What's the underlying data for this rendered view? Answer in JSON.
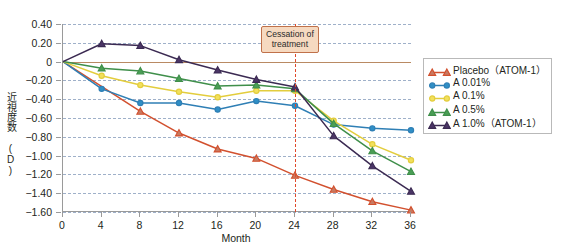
{
  "chart_data": {
    "type": "line",
    "title": "",
    "xlabel": "Month",
    "ylabel": "近視度数 (D)",
    "x": [
      0,
      4,
      8,
      12,
      16,
      20,
      24,
      28,
      32,
      36
    ],
    "xlim": [
      0,
      36
    ],
    "ylim": [
      -1.6,
      0.4
    ],
    "xticks": [
      "0",
      "4",
      "8",
      "12",
      "16",
      "20",
      "24",
      "28",
      "32",
      "36"
    ],
    "yticks": [
      "0.40",
      "0.20",
      "0",
      "-0.20",
      "-0.40",
      "-0.60",
      "-0.80",
      "-1.00",
      "-1.20",
      "-1.40",
      "-1.60"
    ],
    "ytick_values": [
      0.4,
      0.2,
      0,
      -0.2,
      -0.4,
      -0.6,
      -0.8,
      -1.0,
      -1.2,
      -1.4,
      -1.6
    ],
    "grid": true,
    "zero_reference_line": 0,
    "legend_position": "right",
    "series": [
      {
        "name": "Placebo（ATOM-1）",
        "color": "#d2502e",
        "marker": "triangle",
        "marker_fill": "#c87a62",
        "x": [
          0,
          8,
          12,
          16,
          20,
          24,
          28,
          32,
          36
        ],
        "values": [
          0,
          -0.53,
          -0.76,
          -0.93,
          -1.03,
          -1.21,
          -1.36,
          -1.49,
          -1.58
        ]
      },
      {
        "name": "A 0.01%",
        "color": "#2f7fb5",
        "marker": "circle",
        "marker_fill": "#2f8fc6",
        "x": [
          0,
          4,
          8,
          12,
          16,
          20,
          24,
          28,
          32,
          36
        ],
        "values": [
          0,
          -0.29,
          -0.44,
          -0.44,
          -0.51,
          -0.42,
          -0.47,
          -0.67,
          -0.71,
          -0.73
        ]
      },
      {
        "name": "A 0.1%",
        "color": "#e3cd3d",
        "marker": "circle",
        "marker_fill": "#f2e05c",
        "x": [
          0,
          4,
          8,
          12,
          16,
          20,
          24,
          28,
          32,
          36
        ],
        "values": [
          0,
          -0.15,
          -0.25,
          -0.32,
          -0.38,
          -0.31,
          -0.31,
          -0.63,
          -0.88,
          -1.05
        ]
      },
      {
        "name": "A 0.5%",
        "color": "#3f8f4a",
        "marker": "triangle",
        "marker_fill": "#4a9e55",
        "x": [
          0,
          4,
          8,
          12,
          16,
          20,
          24,
          28,
          32,
          36
        ],
        "values": [
          0,
          -0.07,
          -0.1,
          -0.18,
          -0.26,
          -0.25,
          -0.29,
          -0.66,
          -0.95,
          -1.17
        ]
      },
      {
        "name": "A 1.0%（ATOM-1）",
        "color": "#3b2a52",
        "marker": "triangle",
        "marker_fill": "#4b3566",
        "x": [
          0,
          4,
          8,
          12,
          16,
          20,
          24,
          28,
          32,
          36
        ],
        "values": [
          0,
          0.19,
          0.17,
          0.02,
          -0.09,
          -0.19,
          -0.27,
          -0.79,
          -1.11,
          -1.38
        ]
      }
    ],
    "annotations": [
      {
        "name": "cessation-of-treatment",
        "text_line1": "Cessation of",
        "text_line2": "treatment",
        "x": 24,
        "line_style": "dashed",
        "line_color": "#e0492a",
        "box_fill": "#f6d9c0",
        "box_border": "#c0714a"
      }
    ]
  },
  "legend": {
    "items": [
      {
        "label": "Placebo（ATOM-1）"
      },
      {
        "label": "A 0.01%"
      },
      {
        "label": "A 0.1%"
      },
      {
        "label": "A 0.5%"
      },
      {
        "label": "A 1.0%（ATOM-1）"
      }
    ]
  }
}
